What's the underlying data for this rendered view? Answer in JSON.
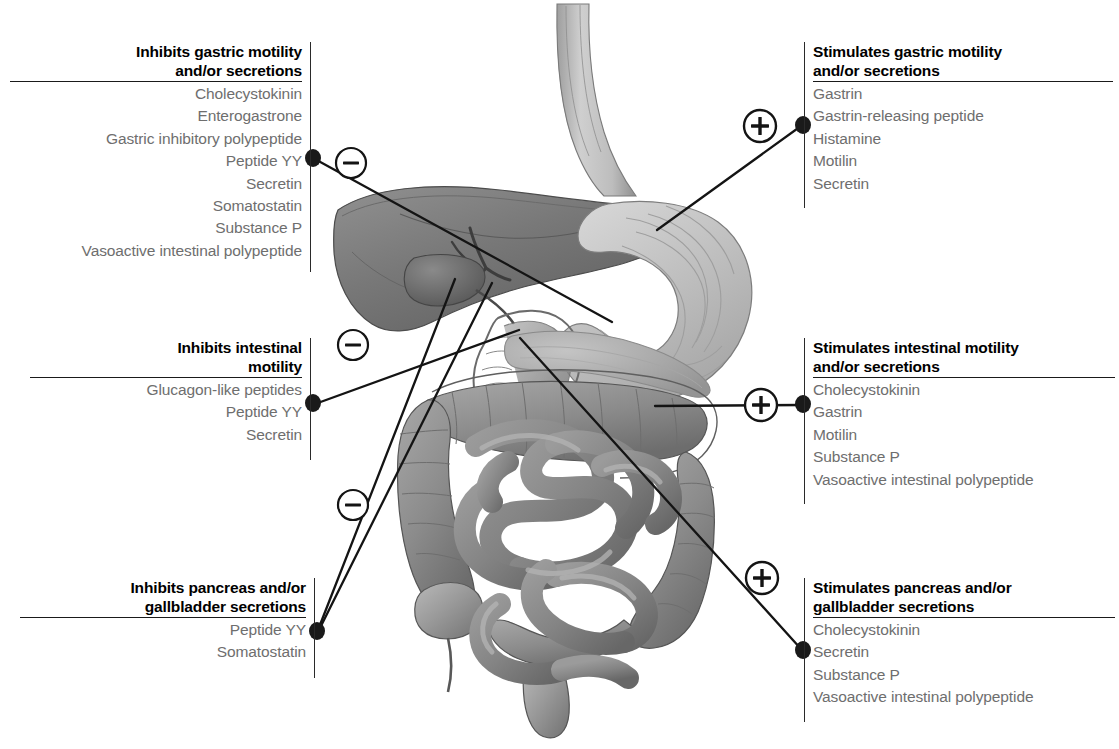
{
  "figure": {
    "type": "anatomical-regulation-diagram",
    "illustration_name": "digestive-tract-illustration",
    "organs_depicted": [
      "esophagus",
      "stomach",
      "liver",
      "gallbladder",
      "bile-duct",
      "duodenum",
      "pancreas",
      "small-intestine",
      "large-intestine",
      "appendix",
      "rectum"
    ],
    "palette": {
      "heading_text": "#000000",
      "item_text": "#6e6e6e",
      "rule": "#1a1a1a",
      "connector": "#1a1a1a",
      "background": "#ffffff"
    }
  },
  "signs": {
    "minus_glyph": "−",
    "plus_glyph": "+",
    "minus_name": "inhibition-sign",
    "plus_name": "stimulation-sign"
  },
  "blocks": {
    "inhibits_gastric": {
      "sign": "−",
      "sign_type": "minus",
      "side": "left",
      "heading_lines": [
        "Inhibits gastric motility",
        "and/or secretions"
      ],
      "items": [
        "Cholecystokinin",
        "Enterogastrone",
        "Gastric inhibitory polypeptide",
        "Peptide YY",
        "Secretin",
        "Somatostatin",
        "Substance P",
        "Vasoactive intestinal polypeptide"
      ]
    },
    "stimulates_gastric": {
      "sign": "+",
      "sign_type": "plus",
      "side": "right",
      "heading_lines": [
        "Stimulates gastric motility",
        "and/or secretions"
      ],
      "items": [
        "Gastrin",
        "Gastrin-releasing peptide",
        "Histamine",
        "Motilin",
        "Secretin"
      ]
    },
    "inhibits_intestinal": {
      "sign": "−",
      "sign_type": "minus",
      "side": "left",
      "heading_lines": [
        "Inhibits intestinal",
        "motility"
      ],
      "items": [
        "Glucagon-like peptides",
        "Peptide YY",
        "Secretin"
      ]
    },
    "stimulates_intestinal": {
      "sign": "+",
      "sign_type": "plus",
      "side": "right",
      "heading_lines": [
        "Stimulates intestinal motility",
        "and/or secretions"
      ],
      "items": [
        "Cholecystokinin",
        "Gastrin",
        "Motilin",
        "Substance P",
        "Vasoactive intestinal polypeptide"
      ]
    },
    "inhibits_pancreas": {
      "sign": "−",
      "sign_type": "minus",
      "side": "left",
      "heading_lines": [
        "Inhibits pancreas and/or",
        "gallbladder secretions"
      ],
      "items": [
        "Peptide YY",
        "Somatostatin"
      ]
    },
    "stimulates_pancreas": {
      "sign": "+",
      "sign_type": "plus",
      "side": "right",
      "heading_lines": [
        "Stimulates pancreas and/or",
        "gallbladder secretions"
      ],
      "items": [
        "Cholecystokinin",
        "Secretin",
        "Substance P",
        "Vasoactive intestinal polypeptide"
      ]
    }
  }
}
